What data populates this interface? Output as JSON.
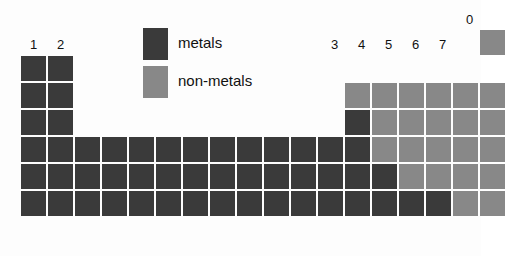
{
  "figure": {
    "kind": "periodic-table-block-diagram",
    "colors": {
      "metal": "#3a3a3a",
      "nonmetal": "#888888",
      "background": "#fdfdfd",
      "text": "#111111"
    }
  },
  "legend": {
    "items": [
      {
        "key": "metal",
        "label": "metals",
        "color": "#3a3a3a"
      },
      {
        "key": "nonmetal",
        "label": "non-metals",
        "color": "#888888"
      }
    ]
  },
  "group_labels": [
    {
      "id": "group-1",
      "text": "1",
      "column": 1,
      "x": 21,
      "y": 38
    },
    {
      "id": "group-2",
      "text": "2",
      "column": 2,
      "x": 48,
      "y": 38
    },
    {
      "id": "group-3",
      "text": "3",
      "column": 13,
      "x": 322,
      "y": 38
    },
    {
      "id": "group-4",
      "text": "4",
      "column": 14,
      "x": 349,
      "y": 38
    },
    {
      "id": "group-5",
      "text": "5",
      "column": 15,
      "x": 376,
      "y": 38
    },
    {
      "id": "group-6",
      "text": "6",
      "column": 16,
      "x": 403,
      "y": 38
    },
    {
      "id": "group-7",
      "text": "7",
      "column": 17,
      "x": 430,
      "y": 38
    },
    {
      "id": "group-0",
      "text": "0",
      "column": 18,
      "x": 457,
      "y": 13
    }
  ],
  "grid": {
    "columns": 18,
    "rows": 6,
    "cell_width": 25,
    "cell_height": 25,
    "pitch_x": 27,
    "pitch_y": 27,
    "origin_x": 21,
    "origin_y": 56,
    "row_labels": [
      "period-1",
      "period-2",
      "period-3",
      "period-4",
      "period-5",
      "period-6"
    ]
  },
  "cells": [
    {
      "row": 1,
      "col": 1,
      "type": "metal"
    },
    {
      "row": 1,
      "col": 2,
      "type": "metal"
    },
    {
      "row": 1,
      "col": 18,
      "type": "nonmetal",
      "raised": true
    },
    {
      "row": 2,
      "col": 1,
      "type": "metal"
    },
    {
      "row": 2,
      "col": 2,
      "type": "metal"
    },
    {
      "row": 2,
      "col": 13,
      "type": "nonmetal"
    },
    {
      "row": 2,
      "col": 14,
      "type": "nonmetal"
    },
    {
      "row": 2,
      "col": 15,
      "type": "nonmetal"
    },
    {
      "row": 2,
      "col": 16,
      "type": "nonmetal"
    },
    {
      "row": 2,
      "col": 17,
      "type": "nonmetal"
    },
    {
      "row": 2,
      "col": 18,
      "type": "nonmetal"
    },
    {
      "row": 3,
      "col": 1,
      "type": "metal"
    },
    {
      "row": 3,
      "col": 2,
      "type": "metal"
    },
    {
      "row": 3,
      "col": 13,
      "type": "metal"
    },
    {
      "row": 3,
      "col": 14,
      "type": "nonmetal"
    },
    {
      "row": 3,
      "col": 15,
      "type": "nonmetal"
    },
    {
      "row": 3,
      "col": 16,
      "type": "nonmetal"
    },
    {
      "row": 3,
      "col": 17,
      "type": "nonmetal"
    },
    {
      "row": 3,
      "col": 18,
      "type": "nonmetal"
    },
    {
      "row": 4,
      "col": 1,
      "type": "metal"
    },
    {
      "row": 4,
      "col": 2,
      "type": "metal"
    },
    {
      "row": 4,
      "col": 3,
      "type": "metal"
    },
    {
      "row": 4,
      "col": 4,
      "type": "metal"
    },
    {
      "row": 4,
      "col": 5,
      "type": "metal"
    },
    {
      "row": 4,
      "col": 6,
      "type": "metal"
    },
    {
      "row": 4,
      "col": 7,
      "type": "metal"
    },
    {
      "row": 4,
      "col": 8,
      "type": "metal"
    },
    {
      "row": 4,
      "col": 9,
      "type": "metal"
    },
    {
      "row": 4,
      "col": 10,
      "type": "metal"
    },
    {
      "row": 4,
      "col": 11,
      "type": "metal"
    },
    {
      "row": 4,
      "col": 12,
      "type": "metal"
    },
    {
      "row": 4,
      "col": 13,
      "type": "metal"
    },
    {
      "row": 4,
      "col": 14,
      "type": "nonmetal"
    },
    {
      "row": 4,
      "col": 15,
      "type": "nonmetal"
    },
    {
      "row": 4,
      "col": 16,
      "type": "nonmetal"
    },
    {
      "row": 4,
      "col": 17,
      "type": "nonmetal"
    },
    {
      "row": 4,
      "col": 18,
      "type": "nonmetal"
    },
    {
      "row": 5,
      "col": 1,
      "type": "metal"
    },
    {
      "row": 5,
      "col": 2,
      "type": "metal"
    },
    {
      "row": 5,
      "col": 3,
      "type": "metal"
    },
    {
      "row": 5,
      "col": 4,
      "type": "metal"
    },
    {
      "row": 5,
      "col": 5,
      "type": "metal"
    },
    {
      "row": 5,
      "col": 6,
      "type": "metal"
    },
    {
      "row": 5,
      "col": 7,
      "type": "metal"
    },
    {
      "row": 5,
      "col": 8,
      "type": "metal"
    },
    {
      "row": 5,
      "col": 9,
      "type": "metal"
    },
    {
      "row": 5,
      "col": 10,
      "type": "metal"
    },
    {
      "row": 5,
      "col": 11,
      "type": "metal"
    },
    {
      "row": 5,
      "col": 12,
      "type": "metal"
    },
    {
      "row": 5,
      "col": 13,
      "type": "metal"
    },
    {
      "row": 5,
      "col": 14,
      "type": "metal"
    },
    {
      "row": 5,
      "col": 15,
      "type": "nonmetal"
    },
    {
      "row": 5,
      "col": 16,
      "type": "nonmetal"
    },
    {
      "row": 5,
      "col": 17,
      "type": "nonmetal"
    },
    {
      "row": 5,
      "col": 18,
      "type": "nonmetal"
    },
    {
      "row": 6,
      "col": 1,
      "type": "metal"
    },
    {
      "row": 6,
      "col": 2,
      "type": "metal"
    },
    {
      "row": 6,
      "col": 3,
      "type": "metal"
    },
    {
      "row": 6,
      "col": 4,
      "type": "metal"
    },
    {
      "row": 6,
      "col": 5,
      "type": "metal"
    },
    {
      "row": 6,
      "col": 6,
      "type": "metal"
    },
    {
      "row": 6,
      "col": 7,
      "type": "metal"
    },
    {
      "row": 6,
      "col": 8,
      "type": "metal"
    },
    {
      "row": 6,
      "col": 9,
      "type": "metal"
    },
    {
      "row": 6,
      "col": 10,
      "type": "metal"
    },
    {
      "row": 6,
      "col": 11,
      "type": "metal"
    },
    {
      "row": 6,
      "col": 12,
      "type": "metal"
    },
    {
      "row": 6,
      "col": 13,
      "type": "metal"
    },
    {
      "row": 6,
      "col": 14,
      "type": "metal"
    },
    {
      "row": 6,
      "col": 15,
      "type": "metal"
    },
    {
      "row": 6,
      "col": 16,
      "type": "metal"
    },
    {
      "row": 6,
      "col": 17,
      "type": "nonmetal"
    },
    {
      "row": 6,
      "col": 18,
      "type": "nonmetal"
    }
  ],
  "legend_layout": {
    "metal_swatch": {
      "x": 143,
      "y": 28,
      "w": 25,
      "h": 32
    },
    "nonmetal_swatch": {
      "x": 143,
      "y": 66,
      "w": 25,
      "h": 32
    },
    "metal_text": {
      "x": 178,
      "y": 35
    },
    "nonmetal_text": {
      "x": 178,
      "y": 73
    }
  }
}
